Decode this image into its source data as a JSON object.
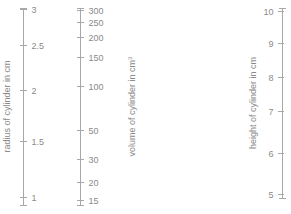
{
  "figure": {
    "type": "nomogram",
    "background_color": "#ffffff",
    "line_color": "#a8a8a8",
    "text_color": "#8a8a8a",
    "width": 291,
    "height": 214
  },
  "chart_data": {
    "type": "line",
    "title": "",
    "subtitle": "",
    "xlabel": "",
    "ylabel": "",
    "grid": false,
    "legend_position": "none",
    "axes": [
      {
        "name": "radius",
        "title": "radius of cylinder in cm",
        "unit": "cm",
        "scale": "linear",
        "label_side": "right",
        "axis_x": 23,
        "axis_top_y": 8,
        "axis_bottom_y": 205,
        "range": [
          0.85,
          3.1
        ],
        "ticks": [
          {
            "value": 3,
            "label": "3",
            "y": 9
          },
          {
            "value": 2.5,
            "label": "2.5",
            "y": 45
          },
          {
            "value": 2,
            "label": "2",
            "y": 90
          },
          {
            "value": 1.5,
            "label": "1.5",
            "y": 141
          },
          {
            "value": 1,
            "label": "1",
            "y": 197
          }
        ]
      },
      {
        "name": "volume",
        "title": "volume of cylinder in cm",
        "title_superscript": "3",
        "unit": "cm^3",
        "scale": "log",
        "label_side": "right",
        "axis_x": 80,
        "axis_top_y": 8,
        "axis_bottom_y": 205,
        "range": [
          14,
          320
        ],
        "ticks": [
          {
            "value": 300,
            "label": "300",
            "y": 10
          },
          {
            "value": 250,
            "label": "250",
            "y": 22
          },
          {
            "value": 200,
            "label": "200",
            "y": 37
          },
          {
            "value": 150,
            "label": "150",
            "y": 57
          },
          {
            "value": 100,
            "label": "100",
            "y": 86
          },
          {
            "value": 50,
            "label": "50",
            "y": 130
          },
          {
            "value": 30,
            "label": "30",
            "y": 159
          },
          {
            "value": 20,
            "label": "20",
            "y": 182
          },
          {
            "value": 15,
            "label": "15",
            "y": 200
          }
        ]
      },
      {
        "name": "height",
        "title": "height of cylinder in cm",
        "unit": "cm",
        "scale": "linear",
        "label_side": "left",
        "axis_x": 282,
        "axis_top_y": 8,
        "axis_bottom_y": 198,
        "range": [
          4.8,
          10.1
        ],
        "ticks": [
          {
            "value": 10,
            "label": "10",
            "y": 11
          },
          {
            "value": 9,
            "label": "9",
            "y": 43
          },
          {
            "value": 8,
            "label": "8",
            "y": 77
          },
          {
            "value": 7,
            "label": "7",
            "y": 111
          },
          {
            "value": 6,
            "label": "6",
            "y": 153
          },
          {
            "value": 5,
            "label": "5",
            "y": 194
          }
        ]
      }
    ]
  }
}
